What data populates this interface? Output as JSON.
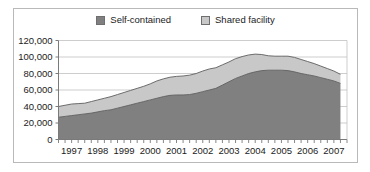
{
  "chart_data": {
    "type": "area",
    "stacked": true,
    "title": "",
    "subtitle": "",
    "xlabel": "",
    "ylabel": "",
    "grid": true,
    "legend_position": "top-center",
    "ylim": [
      0,
      120000
    ],
    "ytick_labels": [
      "0",
      "20,000",
      "40,000",
      "60,000",
      "80,000",
      "100,000",
      "120,000"
    ],
    "ytick_values": [
      0,
      20000,
      40000,
      60000,
      80000,
      100000,
      120000
    ],
    "xtick_labels": [
      "1997",
      "1998",
      "1999",
      "2000",
      "2001",
      "2002",
      "2003",
      "2004",
      "2005",
      "2006",
      "2007"
    ],
    "xlim": [
      1997,
      2008
    ],
    "minor_ticks_per_year": 4,
    "x": [
      1997.0,
      1997.25,
      1997.5,
      1997.75,
      1998.0,
      1998.25,
      1998.5,
      1998.75,
      1999.0,
      1999.25,
      1999.5,
      1999.75,
      2000.0,
      2000.25,
      2000.5,
      2000.75,
      2001.0,
      2001.25,
      2001.5,
      2001.75,
      2002.0,
      2002.25,
      2002.5,
      2002.75,
      2003.0,
      2003.25,
      2003.5,
      2003.75,
      2004.0,
      2004.25,
      2004.5,
      2004.75,
      2005.0,
      2005.25,
      2005.5,
      2005.75,
      2006.0,
      2006.25,
      2006.5,
      2006.75,
      2007.0,
      2007.25,
      2007.5,
      2007.75
    ],
    "series": [
      {
        "name": "Self-contained",
        "color": "#808080",
        "values": [
          27000,
          28000,
          29000,
          30000,
          31000,
          32000,
          33500,
          35000,
          36000,
          38000,
          40000,
          42000,
          44000,
          46000,
          48000,
          50000,
          52000,
          53500,
          54000,
          54000,
          54500,
          56000,
          58000,
          60000,
          62000,
          66000,
          70000,
          74000,
          77000,
          80000,
          82000,
          83500,
          84000,
          84000,
          84000,
          83500,
          82000,
          80000,
          78500,
          77000,
          75000,
          73000,
          71000,
          68000
        ]
      },
      {
        "name": "Shared facility",
        "color": "#c8c8c8",
        "values": [
          13000,
          13500,
          14000,
          13500,
          13000,
          14000,
          14500,
          15000,
          16000,
          16500,
          17000,
          17500,
          18000,
          18500,
          19500,
          21000,
          21500,
          22000,
          22500,
          23000,
          23500,
          24000,
          25000,
          25500,
          25000,
          24500,
          24000,
          24000,
          23500,
          22500,
          21500,
          19500,
          17500,
          17000,
          17000,
          17500,
          17500,
          17000,
          16000,
          15000,
          14000,
          13000,
          12000,
          11000
        ]
      }
    ],
    "totals": [
      40000,
      41500,
      43000,
      43500,
      44000,
      46000,
      48000,
      50000,
      52000,
      54500,
      57000,
      59500,
      62000,
      64500,
      67500,
      71000,
      73500,
      75500,
      76500,
      77000,
      78000,
      80000,
      83000,
      85500,
      87000,
      90500,
      94000,
      98000,
      100500,
      102500,
      103500,
      103000,
      101500,
      101000,
      101000,
      101000,
      99500,
      97000,
      94500,
      92000,
      89000,
      86000,
      83000,
      79000
    ]
  },
  "legend": {
    "entries": [
      {
        "label": "Self-contained",
        "color": "#808080"
      },
      {
        "label": "Shared facility",
        "color": "#c8c8c8"
      }
    ]
  },
  "axis": {
    "y_labels": [
      "120,000",
      "100,000",
      "80,000",
      "60,000",
      "40,000",
      "20,000",
      "0"
    ],
    "x_labels": [
      "1997",
      "1998",
      "1999",
      "2000",
      "2001",
      "2002",
      "2003",
      "2004",
      "2005",
      "2006",
      "2007"
    ]
  },
  "colors": {
    "self_contained": "#808080",
    "shared_facility": "#c8c8c8",
    "gridline": "#c0c0c0",
    "axis": "#7a7a7a",
    "border": "#b9b9b9",
    "text": "#1b1b1b",
    "background": "#ffffff"
  }
}
